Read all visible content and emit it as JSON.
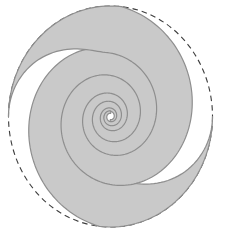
{
  "figure": {
    "background_color": "#ffffff",
    "canvas": {
      "width": 225,
      "height": 234
    },
    "dashed_circle": {
      "cx": 110.5,
      "cy": 116.5,
      "rx": 102,
      "ry": 110.5,
      "stroke_color": "#3d3d3d",
      "stroke_width": 1.1,
      "dash_pattern": "5.5 4"
    },
    "spiral": {
      "type": "two-armed inward spiral, clockwise winding",
      "arm_count": 2,
      "arm_phase_offsets_rad": [
        0,
        3.14159265
      ],
      "decay_k_per_radian": 0.16,
      "contact_arc_span_rad": 1.68,
      "gray_band_phase_width_rad": 3.58,
      "tip_pinch_zone_rad": 1.5,
      "psi_max_rad": 20.5,
      "sample_step_rad": 0.04,
      "fill_color": "#c9c9c9",
      "outline_color": "#8e8e8e",
      "outline_width": 1.2,
      "tip_points": [
        "east",
        "west"
      ],
      "white_sliver_tips": [
        "north",
        "south"
      ],
      "dashes_visible_arcs": [
        "north-east",
        "south-west"
      ],
      "gray_contact_arcs": [
        "south-east",
        "north-west"
      ]
    }
  }
}
